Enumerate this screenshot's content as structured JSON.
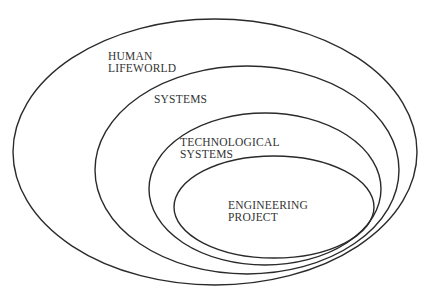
{
  "diagram": {
    "type": "nested-ellipses",
    "stroke_color": "#2a2a2a",
    "text_color": "#333333",
    "levels": [
      {
        "line1": "HUMAN",
        "line2": "LIFEWORLD"
      },
      {
        "line1": "SYSTEMS",
        "line2": ""
      },
      {
        "line1": "TECHNOLOGICAL",
        "line2": "SYSTEMS"
      },
      {
        "line1": "ENGINEERING",
        "line2": "PROJECT"
      }
    ]
  }
}
